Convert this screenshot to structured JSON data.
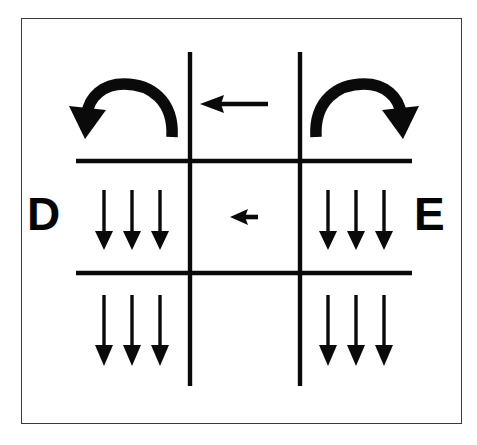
{
  "figure": {
    "background_color": "#ffffff",
    "ink_color": "#050505",
    "frame_color": "#3a3a3a"
  },
  "labels": {
    "left": "D",
    "right": "E"
  },
  "grid": {
    "vertical_lines": [
      {
        "name": "left-vertical-line",
        "x": 190,
        "y1": 52,
        "y2": 386
      },
      {
        "name": "right-vertical-line",
        "x": 300,
        "y1": 52,
        "y2": 386
      }
    ],
    "horizontal_lines": [
      {
        "name": "upper-horizontal-line",
        "y": 161,
        "x1": 76,
        "x2": 412
      },
      {
        "name": "lower-horizontal-line",
        "y": 273,
        "x1": 76,
        "x2": 412
      }
    ],
    "line_width": 4
  },
  "arrows": {
    "curved": [
      {
        "name": "curved-arrow-left",
        "direction": "counterclockwise-down-left",
        "region": "top-left"
      },
      {
        "name": "curved-arrow-right",
        "direction": "clockwise-down-right",
        "region": "top-right"
      }
    ],
    "horizontal": [
      {
        "name": "top-center-left-arrow",
        "direction": "left",
        "region": "top-center",
        "length": 62
      },
      {
        "name": "middle-center-left-arrow",
        "direction": "left",
        "region": "middle-center",
        "length": 30
      }
    ],
    "down_groups": [
      {
        "name": "down-arrows-middle-left",
        "region": "middle-left",
        "direction": "down",
        "count": 3,
        "xs": [
          104,
          132,
          160
        ],
        "y_top": 190,
        "y_bottom": 248
      },
      {
        "name": "down-arrows-middle-right",
        "region": "middle-right",
        "direction": "down",
        "count": 3,
        "xs": [
          328,
          356,
          384
        ],
        "y_top": 190,
        "y_bottom": 248
      },
      {
        "name": "down-arrows-bottom-left",
        "region": "bottom-left",
        "direction": "down",
        "count": 3,
        "xs": [
          104,
          132,
          160
        ],
        "y_top": 295,
        "y_bottom": 365
      },
      {
        "name": "down-arrows-bottom-right",
        "region": "bottom-right",
        "direction": "down",
        "count": 3,
        "xs": [
          328,
          356,
          384
        ],
        "y_top": 295,
        "y_bottom": 365
      }
    ]
  }
}
